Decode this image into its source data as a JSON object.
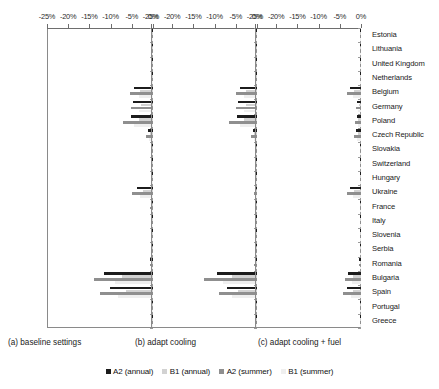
{
  "chart_data": {
    "type": "bar",
    "orientation": "horizontal",
    "title": "",
    "xlabel": "",
    "ylabel": "",
    "xlim": [
      -25,
      0
    ],
    "xticks": [
      -25,
      -20,
      -15,
      -10,
      -5,
      0
    ],
    "xtick_labels": [
      "-25%",
      "-20%",
      "-15%",
      "-10%",
      "-5%",
      "0%"
    ],
    "grid": false,
    "legend_position": "bottom",
    "categories": [
      "Estonia",
      "Lithuania",
      "United Kingdom",
      "Netherlands",
      "Belgium",
      "Germany",
      "Poland",
      "Czech Republic",
      "Slovakia",
      "Switzerland",
      "Hungary",
      "Ukraine",
      "France",
      "Italy",
      "Slovenia",
      "Serbia",
      "Romania",
      "Bulgaria",
      "Spain",
      "Portugal",
      "Greece"
    ],
    "series_names": [
      "A2 (annual)",
      "B1 (annual)",
      "A2 (summer)",
      "B1 (summer)"
    ],
    "series_colors": [
      "#1c1c1c",
      "#d2d2d2",
      "#8f8f8f",
      "#efefef"
    ],
    "panels": [
      {
        "key": "baseline",
        "caption": "(a) baseline settings",
        "series": [
          {
            "name": "A2 (annual)",
            "values": [
              -0.1,
              -0.1,
              -0.2,
              -0.3,
              -4.5,
              -4.8,
              -5.2,
              -1.2,
              -0.2,
              -0.2,
              -0.3,
              -3.8,
              -0.4,
              -0.2,
              -0.2,
              -0.2,
              -0.6,
              -11.5,
              -10.2,
              -0.3,
              -0.2
            ]
          },
          {
            "name": "B1 (annual)",
            "values": [
              -0.1,
              -0.1,
              -0.1,
              -0.2,
              -3.0,
              -2.8,
              -3.2,
              -0.8,
              -0.1,
              -0.1,
              -0.2,
              -2.4,
              -0.3,
              -0.1,
              -0.1,
              -0.1,
              -0.4,
              -7.2,
              -6.4,
              -0.2,
              -0.1
            ]
          },
          {
            "name": "A2 (summer)",
            "values": [
              -0.2,
              -0.2,
              -0.3,
              -0.4,
              -5.5,
              -5.2,
              -7.0,
              -1.6,
              -0.3,
              -0.3,
              -0.4,
              -5.0,
              -0.6,
              -0.3,
              -0.3,
              -0.3,
              -0.8,
              -14.0,
              -12.6,
              -0.4,
              -0.3
            ]
          },
          {
            "name": "B1 (summer)",
            "values": [
              -0.1,
              -0.1,
              -0.2,
              -0.3,
              -3.4,
              -3.2,
              -4.4,
              -1.0,
              -0.2,
              -0.2,
              -0.3,
              -3.0,
              -0.4,
              -0.2,
              -0.2,
              -0.2,
              -0.5,
              -9.0,
              -8.2,
              -0.3,
              -0.2
            ]
          }
        ]
      },
      {
        "key": "adapt_cooling",
        "caption": "(b) adapt cooling",
        "series": [
          {
            "name": "A2 (annual)",
            "values": [
              -0.1,
              -0.1,
              -0.2,
              -0.2,
              -4.0,
              -4.4,
              -4.8,
              -1.0,
              -0.2,
              -0.2,
              -0.2,
              -0.5,
              -0.3,
              -0.2,
              -0.2,
              -0.2,
              -0.5,
              -9.5,
              -7.0,
              -0.3,
              -0.2
            ]
          },
          {
            "name": "B1 (annual)",
            "values": [
              -0.1,
              -0.1,
              -0.1,
              -0.1,
              -2.6,
              -2.6,
              -3.0,
              -0.6,
              -0.1,
              -0.1,
              -0.1,
              -0.3,
              -0.2,
              -0.1,
              -0.1,
              -0.1,
              -0.3,
              -6.0,
              -4.6,
              -0.2,
              -0.1
            ]
          },
          {
            "name": "A2 (summer)",
            "values": [
              -0.2,
              -0.2,
              -0.3,
              -0.3,
              -5.0,
              -5.0,
              -6.6,
              -1.4,
              -0.2,
              -0.2,
              -0.3,
              -0.7,
              -0.4,
              -0.2,
              -0.2,
              -0.2,
              -0.6,
              -12.4,
              -9.0,
              -0.4,
              -0.2
            ]
          },
          {
            "name": "B1 (summer)",
            "values": [
              -0.1,
              -0.1,
              -0.2,
              -0.2,
              -3.0,
              -3.0,
              -4.0,
              -0.8,
              -0.1,
              -0.1,
              -0.2,
              -0.4,
              -0.3,
              -0.1,
              -0.1,
              -0.1,
              -0.4,
              -8.0,
              -5.8,
              -0.3,
              -0.1
            ]
          }
        ]
      },
      {
        "key": "adapt_cooling_fuel",
        "caption": "(c) adapt cooling + fuel",
        "series": [
          {
            "name": "A2 (annual)",
            "values": [
              -0.1,
              -0.1,
              -0.1,
              -0.2,
              -2.6,
              -0.9,
              -1.0,
              -1.2,
              -0.1,
              -0.1,
              -0.2,
              -2.6,
              -0.2,
              -0.1,
              -0.1,
              -0.1,
              -0.4,
              -3.0,
              -3.4,
              -0.2,
              -0.2
            ]
          },
          {
            "name": "B1 (annual)",
            "values": [
              -0.1,
              -0.1,
              -0.1,
              -0.1,
              -1.6,
              -0.5,
              -0.6,
              -0.7,
              -0.1,
              -0.1,
              -0.1,
              -1.6,
              -0.1,
              -0.1,
              -0.1,
              -0.1,
              -0.2,
              -1.8,
              -2.0,
              -0.1,
              -0.1
            ]
          },
          {
            "name": "A2 (summer)",
            "values": [
              -0.2,
              -0.2,
              -0.2,
              -0.3,
              -3.2,
              -1.2,
              -1.4,
              -1.6,
              -0.2,
              -0.2,
              -0.2,
              -3.2,
              -0.3,
              -0.2,
              -0.2,
              -0.2,
              -0.5,
              -3.8,
              -4.2,
              -0.3,
              -0.2
            ]
          },
          {
            "name": "B1 (summer)",
            "values": [
              -0.1,
              -0.1,
              -0.1,
              -0.2,
              -2.0,
              -0.7,
              -0.8,
              -0.9,
              -0.1,
              -0.1,
              -0.1,
              -2.0,
              -0.2,
              -0.1,
              -0.1,
              -0.1,
              -0.3,
              -2.2,
              -2.4,
              -0.2,
              -0.1
            ]
          }
        ]
      }
    ]
  }
}
